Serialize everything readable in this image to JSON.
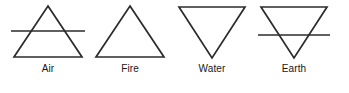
{
  "figure": {
    "background_color": "#ffffff",
    "stroke_color": "#2b2b2b",
    "label_color": "#161616"
  },
  "elements": [
    {
      "label": "Air",
      "glyph": "upward-triangle-with-horizontal-line",
      "direction": "up",
      "has_crossbar": true
    },
    {
      "label": "Fire",
      "glyph": "upward-triangle",
      "direction": "up",
      "has_crossbar": false
    },
    {
      "label": "Water",
      "glyph": "downward-triangle",
      "direction": "down",
      "has_crossbar": false
    },
    {
      "label": "Earth",
      "glyph": "downward-triangle-with-horizontal-line",
      "direction": "down",
      "has_crossbar": true
    }
  ]
}
